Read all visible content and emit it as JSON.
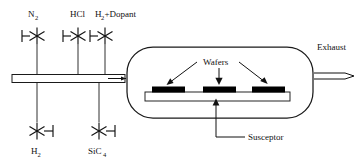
{
  "diagram": {
    "type": "process-equipment-schematic",
    "background_color": "#ffffff",
    "line_color": "#1a1a1a",
    "wafer_color": "#000000"
  },
  "gas_inlets_top": [
    {
      "id": "n2",
      "label": "N",
      "subscript": "2",
      "full_label": "N2",
      "valve": "star-valve",
      "valve_tick_side": "left"
    },
    {
      "id": "hcl",
      "label": "HCl",
      "subscript": "",
      "full_label": "HCl",
      "valve": "star-valve",
      "valve_tick_side": "left"
    },
    {
      "id": "h2-dopant",
      "label_part1": "H",
      "subscript": "2",
      "label_part2": "+Dopant",
      "full_label": "H2+Dopant",
      "valve": "star-valve",
      "valve_tick_side": "left"
    }
  ],
  "gas_inlets_bottom": [
    {
      "id": "h2",
      "label": "H",
      "subscript": "2",
      "full_label": "H2",
      "valve": "star-valve",
      "valve_tick_side": "right"
    },
    {
      "id": "sic4",
      "label": "SiC",
      "subscript": "4",
      "full_label": "SiC4",
      "valve": "star-valve",
      "valve_tick_side": "right"
    }
  ],
  "chamber": {
    "name": "reactor-chamber",
    "shape": "rounded-rectangle",
    "wafer_count": 3
  },
  "annotations": {
    "wafers_label": "Wafers",
    "susceptor_label": "Susceptor",
    "exhaust_label": "Exhaust"
  },
  "icons": {
    "valve_icon": "star-valve-icon",
    "arrow_icon": "arrow-icon",
    "exhaust_arrow_icon": "double-line-arrow-icon",
    "inlet_arrow_icon": "inlet-arrow-icon"
  }
}
